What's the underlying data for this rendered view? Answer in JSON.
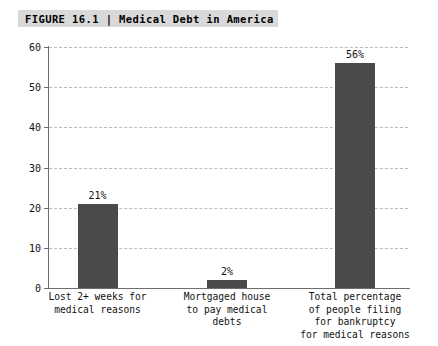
{
  "figure": {
    "label": "FIGURE 16.1",
    "separator": "|",
    "title": "Medical Debt in America",
    "full_title": "FIGURE 16.1 | Medical Debt in America",
    "band_color": "#d9d9d9"
  },
  "chart_data": {
    "type": "bar",
    "title": "FIGURE 16.1 | Medical Debt in America",
    "xlabel": "",
    "ylabel": "",
    "ylim": [
      0,
      60
    ],
    "yticks": [
      0,
      10,
      20,
      30,
      40,
      50,
      60
    ],
    "ytick_labels": [
      "0",
      "10",
      "20",
      "30",
      "40",
      "50",
      "60"
    ],
    "grid": true,
    "grid_style": "dashed",
    "grid_color": "#b9bdc4",
    "legend": false,
    "bar_color": "#4a4a4a",
    "categories": [
      "Lost 2+ weeks for medical reasons",
      "Mortgaged house to pay medical debts",
      "Total percentage of people filing for bankruptcy for medical reasons"
    ],
    "category_lines": [
      [
        "Lost 2+ weeks for",
        "medical reasons"
      ],
      [
        "Mortgaged house",
        "to pay medical",
        "debts"
      ],
      [
        "Total percentage",
        "of people filing",
        "for bankruptcy",
        "for medical reasons"
      ]
    ],
    "values": [
      21,
      2,
      56
    ],
    "data_labels": [
      "21%",
      "2%",
      "56%"
    ]
  }
}
